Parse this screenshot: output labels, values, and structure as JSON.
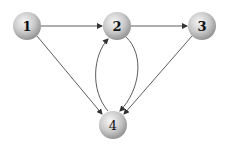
{
  "graph": {
    "nodes": [
      {
        "id": "1",
        "label": "1",
        "x": 27,
        "y": 26
      },
      {
        "id": "2",
        "label": "2",
        "x": 117,
        "y": 26
      },
      {
        "id": "3",
        "label": "3",
        "x": 202,
        "y": 26
      },
      {
        "id": "4",
        "label": "4",
        "x": 113,
        "y": 125
      }
    ],
    "edges": [
      {
        "from": "1",
        "to": "2"
      },
      {
        "from": "2",
        "to": "3"
      },
      {
        "from": "1",
        "to": "4"
      },
      {
        "from": "3",
        "to": "4"
      },
      {
        "from": "2",
        "to": "4"
      },
      {
        "from": "4",
        "to": "2"
      }
    ],
    "colors": {
      "edge": "#333333",
      "node_light": "#f4f4f4",
      "node_dark": "#9a9a9a"
    }
  }
}
